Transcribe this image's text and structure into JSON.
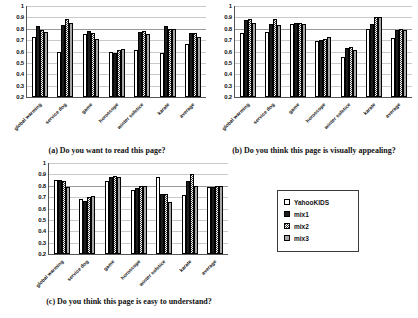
{
  "legend": {
    "entries": [
      {
        "label": "YahooKIDS",
        "series_key": "s0"
      },
      {
        "label": "mix1",
        "series_key": "s1"
      },
      {
        "label": "mix2",
        "series_key": "s2"
      },
      {
        "label": "mix3",
        "series_key": "s3"
      }
    ]
  },
  "captions": {
    "a": "(a) Do you want to read this page?",
    "b": "(b) Do you think this page is visually appealing?",
    "c": "(c) Do you think this page is easy to understand?"
  },
  "chart_data": [
    {
      "id": "a",
      "type": "bar",
      "title": "(a) Do you want to read this page?",
      "xlabel": "",
      "ylabel": "",
      "ylim": [
        0.2,
        1
      ],
      "yticks": [
        1,
        0.9,
        0.8,
        0.7,
        0.6,
        0.5,
        0.4,
        0.3,
        0.2
      ],
      "ytick_labels": [
        "1",
        "0.9",
        "0.8",
        "0.7",
        "0.6",
        "0.5",
        "0.4",
        "0.3",
        "0.2"
      ],
      "grid": true,
      "legend_position": "external-right",
      "categories": [
        "global warming",
        "service dog",
        "game",
        "horoscope",
        "winter solstice",
        "karate",
        "average"
      ],
      "series": [
        {
          "name": "YahooKIDS",
          "values": [
            0.73,
            0.6,
            0.75,
            0.6,
            0.61,
            0.59,
            0.67
          ]
        },
        {
          "name": "mix1",
          "values": [
            0.82,
            0.83,
            0.78,
            0.59,
            0.77,
            0.82,
            0.76
          ]
        },
        {
          "name": "mix2",
          "values": [
            0.79,
            0.89,
            0.76,
            0.61,
            0.78,
            0.8,
            0.76
          ]
        },
        {
          "name": "mix3",
          "values": [
            0.77,
            0.85,
            0.71,
            0.62,
            0.75,
            0.8,
            0.73
          ]
        }
      ]
    },
    {
      "id": "b",
      "type": "bar",
      "title": "(b) Do you think this page is visually appealing?",
      "xlabel": "",
      "ylabel": "",
      "ylim": [
        0.2,
        1
      ],
      "yticks": [
        1,
        0.9,
        0.8,
        0.7,
        0.6,
        0.5,
        0.4,
        0.3,
        0.2
      ],
      "ytick_labels": [
        "1",
        "0.9",
        "0.8",
        "0.7",
        "0.6",
        "0.5",
        "0.4",
        "0.3",
        "0.2"
      ],
      "grid": true,
      "legend_position": "external-right",
      "categories": [
        "global warming",
        "service dog",
        "game",
        "horoscope",
        "winter solstice",
        "karate",
        "average"
      ],
      "series": [
        {
          "name": "YahooKIDS",
          "values": [
            0.76,
            0.77,
            0.84,
            0.69,
            0.55,
            0.8,
            0.72
          ]
        },
        {
          "name": "mix1",
          "values": [
            0.88,
            0.84,
            0.85,
            0.7,
            0.63,
            0.84,
            0.79
          ]
        },
        {
          "name": "mix2",
          "values": [
            0.89,
            0.89,
            0.85,
            0.71,
            0.64,
            0.9,
            0.8
          ]
        },
        {
          "name": "mix3",
          "values": [
            0.85,
            0.83,
            0.84,
            0.73,
            0.61,
            0.9,
            0.79
          ]
        }
      ]
    },
    {
      "id": "c",
      "type": "bar",
      "title": "(c) Do you think this page is easy to understand?",
      "xlabel": "",
      "ylabel": "",
      "ylim": [
        0.2,
        1
      ],
      "yticks": [
        1,
        0.9,
        0.8,
        0.7,
        0.6,
        0.5,
        0.4,
        0.3,
        0.2
      ],
      "ytick_labels": [
        "1",
        "0.9",
        "0.8",
        "0.7",
        "0.6",
        "0.5",
        "0.4",
        "0.3",
        "0.2"
      ],
      "grid": true,
      "legend_position": "external-right",
      "categories": [
        "global warming",
        "service dog",
        "game",
        "horoscope",
        "winter solstice",
        "karate",
        "average"
      ],
      "series": [
        {
          "name": "YahooKIDS",
          "values": [
            0.85,
            0.68,
            0.84,
            0.76,
            0.88,
            0.72,
            0.79
          ]
        },
        {
          "name": "mix1",
          "values": [
            0.85,
            0.67,
            0.88,
            0.78,
            0.73,
            0.84,
            0.79
          ]
        },
        {
          "name": "mix2",
          "values": [
            0.84,
            0.7,
            0.89,
            0.8,
            0.73,
            0.9,
            0.8
          ]
        },
        {
          "name": "mix3",
          "values": [
            0.79,
            0.71,
            0.88,
            0.8,
            0.66,
            0.8,
            0.8
          ]
        }
      ]
    }
  ]
}
